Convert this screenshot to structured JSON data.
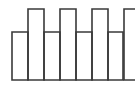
{
  "figure": {
    "canvas": {
      "width": 135,
      "height": 90,
      "background_color": "#ffffff"
    },
    "style": {
      "stroke_color": "#3a3a3a",
      "stroke_width": 1.6,
      "fill": "none"
    },
    "geometry": {
      "tall_rect_top_y": 9,
      "tall_rect_bottom_y": 80,
      "short_rect_top_y": 32,
      "short_rect_bottom_y": 80,
      "vertical_line_x": [
        12,
        28,
        44,
        60,
        76,
        92,
        108,
        123
      ]
    },
    "tall_rectangles": [
      {
        "name": "tall-rect-1",
        "x": 28,
        "y": 9,
        "width": 16,
        "height": 71
      },
      {
        "name": "tall-rect-2",
        "x": 60,
        "y": 9,
        "width": 16,
        "height": 71
      },
      {
        "name": "tall-rect-3",
        "x": 92,
        "y": 9,
        "width": 16,
        "height": 71
      },
      {
        "name": "tall-rect-4",
        "x": 124,
        "y": 9,
        "width": 16,
        "height": 71
      }
    ],
    "short_rectangles": [
      {
        "name": "short-rect-1",
        "x": 12,
        "y": 32,
        "width": 16,
        "height": 48
      },
      {
        "name": "short-rect-2",
        "x": 44,
        "y": 32,
        "width": 16,
        "height": 48
      },
      {
        "name": "short-rect-3",
        "x": 76,
        "y": 32,
        "width": 16,
        "height": 48
      },
      {
        "name": "short-rect-4",
        "x": 108,
        "y": 32,
        "width": 15,
        "height": 48
      }
    ],
    "counts": {
      "tall_rectangles": 4,
      "short_rectangles": 4,
      "vertical_lines": 8
    }
  }
}
